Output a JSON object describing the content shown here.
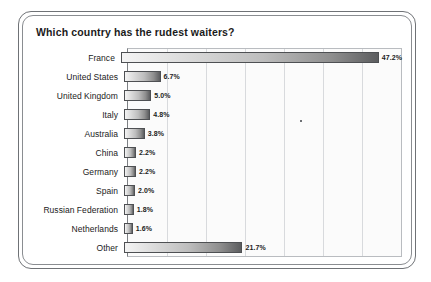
{
  "chart_data": {
    "type": "bar",
    "orientation": "horizontal",
    "title": "Which country has the rudest waiters?",
    "xlabel": "",
    "ylabel": "",
    "categories": [
      "France",
      "United States",
      "United Kingdom",
      "Italy",
      "Australia",
      "China",
      "Germany",
      "Spain",
      "Russian Federation",
      "Netherlands",
      "Other"
    ],
    "values": [
      47.2,
      6.7,
      5.0,
      4.8,
      3.8,
      2.2,
      2.2,
      2.0,
      1.8,
      1.6,
      21.7
    ],
    "value_labels": [
      "47.2%",
      "6.7%",
      "5.0%",
      "4.8%",
      "3.8%",
      "2.2%",
      "2.2%",
      "2.0%",
      "1.8%",
      "1.6%",
      "21.7%"
    ],
    "xlim": [
      0,
      50
    ],
    "grid": true,
    "gridlines": [
      0,
      7.14,
      14.29,
      21.43,
      28.57,
      35.71,
      42.86,
      50
    ],
    "legend": "none",
    "colors": {
      "bar_start": "#f4f4f4",
      "bar_end": "#5c5d5f",
      "bar_border": "#4e5053",
      "plot_background": "#fbfbfb",
      "gridline": "#d8dadd",
      "frame_outer": "#6f7276",
      "frame_inner": "#8a8d91",
      "text": "#1b1b1b"
    }
  }
}
